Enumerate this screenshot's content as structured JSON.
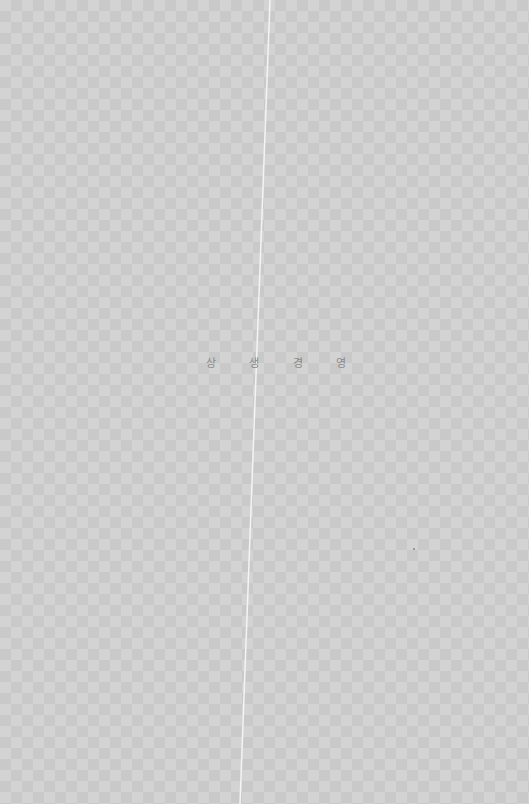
{
  "page": {
    "title_chars": [
      "상",
      "생",
      "경",
      "영"
    ],
    "title_text": "상생경영",
    "background": {
      "checker_light": "#d3d3d3",
      "checker_dark": "#c9c9c9"
    },
    "text_color": "#8a8a8a",
    "fold_line_color": "#f2f2f2"
  }
}
